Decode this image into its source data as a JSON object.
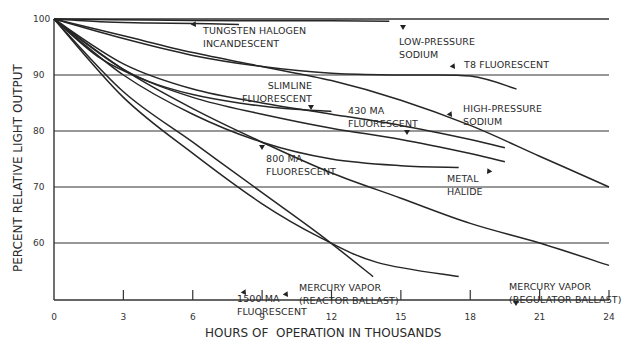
{
  "chart_data": {
    "type": "line",
    "title": "",
    "xlabel": "HOURS OF  OPERATION IN THOUSANDS",
    "ylabel": "PERCENT RELATIVE LIGHT OUTPUT",
    "xlim": [
      0,
      24
    ],
    "ylim": [
      50,
      100
    ],
    "x_ticks": [
      0,
      3,
      6,
      9,
      12,
      15,
      18,
      21,
      24
    ],
    "y_ticks": [
      60,
      70,
      80,
      90,
      100
    ],
    "grid": "horizontal lines at 60, 70, 80, 90, 100",
    "legend": "none (curves labeled inline with arrows)",
    "series": [
      {
        "name": "TUNGSTEN HALOGEN INCANDESCENT",
        "label_lines": [
          "TUNGSTEN HALOGEN",
          "INCANDESCENT"
        ],
        "x": [
          0,
          2,
          4,
          6,
          8
        ],
        "values": [
          100,
          99.5,
          99.3,
          99.2,
          99.0
        ]
      },
      {
        "name": "LOW-PRESSURE SODIUM",
        "label_lines": [
          "LOW-PRESSURE",
          "SODIUM"
        ],
        "x": [
          0,
          4,
          8,
          12,
          14.5
        ],
        "values": [
          100,
          99.8,
          99.7,
          99.7,
          99.6
        ]
      },
      {
        "name": "T8 FLUORESCENT",
        "label_lines": [
          "T8 FLUORESCENT"
        ],
        "x": [
          0,
          3,
          6,
          9,
          12,
          15,
          18,
          20
        ],
        "values": [
          100,
          96.5,
          93.5,
          91.5,
          90.3,
          90,
          89.8,
          87.5
        ]
      },
      {
        "name": "SLIMLINE FLUORESCENT",
        "label_lines": [
          "SLIMLINE",
          "FLUORESCENT"
        ],
        "x": [
          0,
          2,
          4,
          6,
          8,
          10,
          12
        ],
        "values": [
          100,
          93,
          89,
          86.5,
          85,
          84,
          83.5
        ]
      },
      {
        "name": "430 MA FLUORESCENT",
        "label_lines": [
          "430 MA",
          "FLUORESCENT"
        ],
        "x": [
          0,
          3,
          6,
          9,
          12,
          15,
          18,
          19.5
        ],
        "values": [
          100,
          92,
          87.5,
          85,
          83,
          81,
          78.5,
          77
        ]
      },
      {
        "name": "HIGH-PRESSURE SODIUM",
        "label_lines": [
          "HIGH-PRESSURE",
          "SODIUM"
        ],
        "x": [
          0,
          3,
          6,
          9,
          12,
          15,
          18,
          21,
          24
        ],
        "values": [
          100,
          97,
          94,
          91.5,
          89,
          85.5,
          81,
          75.5,
          70
        ]
      },
      {
        "name": "METAL HALIDE",
        "label_lines": [
          "METAL",
          "HALIDE"
        ],
        "x": [
          0,
          3,
          6,
          9,
          12,
          15,
          18,
          19.5
        ],
        "values": [
          100,
          91,
          86,
          83,
          80.5,
          78.5,
          76,
          74.5
        ]
      },
      {
        "name": "800 MA FLUORESCENT",
        "label_lines": [
          "800 MA",
          "FLUORESCENT"
        ],
        "x": [
          0,
          3,
          6,
          9,
          12,
          15,
          17.5
        ],
        "values": [
          100,
          90,
          83,
          78,
          75,
          73.8,
          73.5
        ]
      },
      {
        "name": "MERCURY VAPOR (REGULATOR BALLAST)",
        "label_lines": [
          "MERCURY VAPOR",
          "(REGULATOR BALLAST)"
        ],
        "x": [
          0,
          3,
          6,
          9,
          12,
          15,
          18,
          21,
          24
        ],
        "values": [
          100,
          91,
          84,
          78,
          72.5,
          68,
          63.5,
          60,
          56
        ]
      },
      {
        "name": "MERCURY VAPOR (REACTOR BALLAST)",
        "label_lines": [
          "MERCURY VAPOR",
          "(REACTOR BALLAST)"
        ],
        "x": [
          0,
          3,
          6,
          9,
          11.5,
          14,
          17.5
        ],
        "values": [
          100,
          86,
          76,
          67,
          61,
          56.5,
          54
        ]
      },
      {
        "name": "1500 MA FLUORESCENT",
        "label_lines": [
          "1500 MA",
          "FLUORESCENT"
        ],
        "x": [
          0,
          3,
          6,
          9,
          11.5,
          13.8
        ],
        "values": [
          100,
          87,
          78,
          69,
          61.5,
          54
        ]
      }
    ]
  }
}
